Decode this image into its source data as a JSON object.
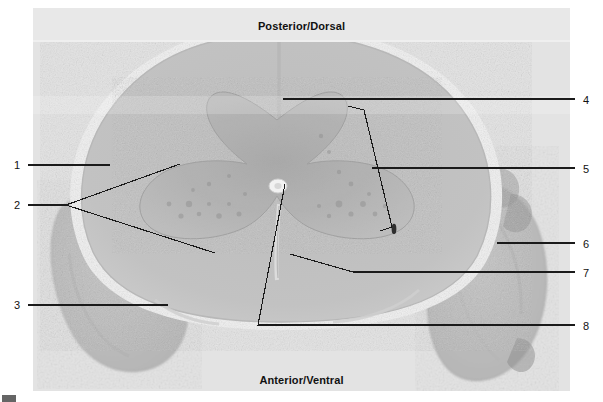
{
  "figure": {
    "kind": "histology-micrograph",
    "stain_tone": "grayscale",
    "background_color": "#ffffff",
    "plate_color": "#e3e3e3",
    "leader_color": "#1a1a1a"
  },
  "orientation": {
    "top_label": "Posterior/Dorsal",
    "bottom_label": "Anterior/Ventral"
  },
  "labels": [
    {
      "id": "1",
      "text": "1",
      "side": "left",
      "x": 14,
      "y": 160
    },
    {
      "id": "2",
      "text": "2",
      "side": "left",
      "x": 14,
      "y": 200
    },
    {
      "id": "3",
      "text": "3",
      "side": "left",
      "x": 14,
      "y": 300
    },
    {
      "id": "4",
      "text": "4",
      "side": "right",
      "x": 583,
      "y": 95
    },
    {
      "id": "5",
      "text": "5",
      "side": "right",
      "x": 583,
      "y": 164
    },
    {
      "id": "6",
      "text": "6",
      "side": "right",
      "x": 583,
      "y": 239
    },
    {
      "id": "7",
      "text": "7",
      "side": "right",
      "x": 583,
      "y": 268
    },
    {
      "id": "8",
      "text": "8",
      "side": "right",
      "x": 583,
      "y": 325
    }
  ],
  "leaders": [
    {
      "for": "1",
      "points": "28,165 110,165"
    },
    {
      "for": "2a",
      "points": "28,205 66,205 180,164"
    },
    {
      "for": "2b",
      "points": "66,205 215,253"
    },
    {
      "for": "3",
      "points": "28,305 168,305"
    },
    {
      "for": "4",
      "points": "283,99 575,99"
    },
    {
      "for": "5-bracket",
      "points": "348,106 364,110 392,227"
    },
    {
      "for": "5-bracket-tick",
      "points": "380,231 392,227"
    },
    {
      "for": "5",
      "points": "372,168 575,168"
    },
    {
      "for": "6",
      "points": "497,243 575,243"
    },
    {
      "for": "7",
      "points": "290,254 353,272 575,272"
    },
    {
      "for": "8",
      "points": "285,184 258,325 575,325"
    }
  ],
  "icons": {
    "corner_mark": "page-corner-mark"
  }
}
